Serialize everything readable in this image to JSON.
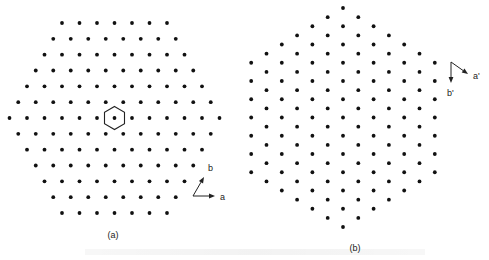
{
  "figure": {
    "panel_a": {
      "label": "(a)",
      "label_pos": [
        113,
        238
      ],
      "lattice": {
        "orientation": "rows-horizontal",
        "center": [
          114.5,
          118
        ],
        "spacing_x": 17.5,
        "spacing_y": 15.83,
        "row_counts": [
          7,
          8,
          9,
          10,
          11,
          12,
          13,
          12,
          11,
          10,
          9,
          8,
          7
        ]
      },
      "hexagon": {
        "center": [
          114.5,
          118
        ],
        "radius": 11.5,
        "orientation": "pointy-top"
      },
      "axes": {
        "origin": [
          193,
          196
        ],
        "a": {
          "label": "a",
          "tip": [
            215,
            196
          ],
          "label_pos": [
            220,
            200
          ]
        },
        "b": {
          "label": "b",
          "tip": [
            204,
            177
          ],
          "label_pos": [
            208,
            171
          ]
        }
      }
    },
    "panel_b": {
      "label": "(b)",
      "label_pos": [
        355,
        251
      ],
      "lattice": {
        "orientation": "columns-vertical",
        "center": [
          343,
          117.5
        ],
        "spacing_x": 15.3,
        "spacing_y": 18.25,
        "column_counts": [
          7,
          8,
          9,
          10,
          11,
          12,
          13,
          12,
          11,
          10,
          9,
          8,
          7
        ]
      },
      "axes": {
        "origin": [
          451,
          62
        ],
        "a_prime": {
          "label": "a'",
          "tip": [
            468,
            74
          ],
          "label_pos": [
            473,
            79
          ]
        },
        "b_prime": {
          "label": "b'",
          "tip": [
            451,
            83
          ],
          "label_pos": [
            447,
            96
          ]
        }
      }
    },
    "colors": {
      "dot": "#111111",
      "line": "#222222",
      "background": "#ffffff"
    },
    "dot_radius": 1.9
  }
}
